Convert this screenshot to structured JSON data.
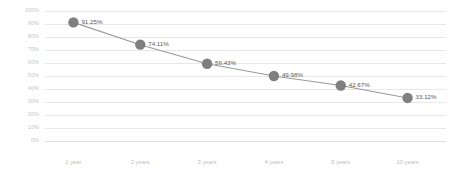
{
  "chart_data": {
    "type": "line",
    "title": "",
    "subtitle": "",
    "xlabel": "",
    "ylabel": "",
    "categories": [
      "1 year",
      "2 years",
      "3 years",
      "4 years",
      "5 years",
      "10 years"
    ],
    "values": [
      91.25,
      74.11,
      59.43,
      49.98,
      42.67,
      33.12
    ],
    "point_labels": [
      "91.25%",
      "74.11%",
      "59.43%",
      "49.98%",
      "42.67%",
      "33.12%"
    ],
    "ylim": [
      0,
      100
    ],
    "ytick_values": [
      100,
      90,
      80,
      70,
      60,
      50,
      40,
      30,
      20,
      10,
      0
    ],
    "ytick_labels": [
      "100%",
      "90%",
      "80%",
      "70%",
      "60%",
      "50%",
      "40%",
      "30%",
      "20%",
      "10%",
      "0%"
    ],
    "grid": true,
    "legend": false,
    "legend_position": "none",
    "series": [
      {
        "name": "",
        "values": [
          91.25,
          74.11,
          59.43,
          49.98,
          42.67,
          33.12
        ]
      }
    ],
    "colors": {
      "marker": "#7f7f7f",
      "line": "#9a9a9a",
      "gridline": "#e8e8e8",
      "tick_label": "#c6c6c6",
      "point_label": "#5a5a5a",
      "background": "#ffffff"
    }
  }
}
